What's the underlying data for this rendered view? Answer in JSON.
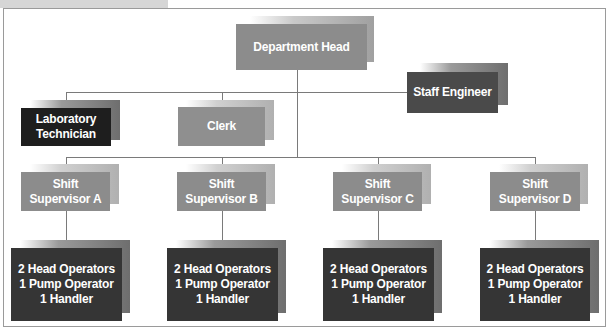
{
  "chart": {
    "title": "",
    "nodes": {
      "department_head": {
        "label": "Department Head",
        "color": "#8c8c8c"
      },
      "staff_engineer": {
        "label": "Staff Engineer",
        "color": "#4a4a4a"
      },
      "laboratory_technician": {
        "line1": "Laboratory",
        "line2": "Technician",
        "color": "#1e1e1e"
      },
      "clerk": {
        "label": "Clerk",
        "color": "#8f8f8f"
      },
      "shift_supervisors": [
        {
          "line1": "Shift",
          "line2": "Supervisor A",
          "color": "#8c8c8c"
        },
        {
          "line1": "Shift",
          "line2": "Supervisor B",
          "color": "#8c8c8c"
        },
        {
          "line1": "Shift",
          "line2": "Supervisor C",
          "color": "#8c8c8c"
        },
        {
          "line1": "Shift",
          "line2": "Supervisor D",
          "color": "#8c8c8c"
        }
      ],
      "crews": [
        {
          "line1": "2 Head Operators",
          "line2": "1 Pump Operator",
          "line3": "1 Handler",
          "color": "#353535"
        },
        {
          "line1": "2 Head Operators",
          "line2": "1 Pump Operator",
          "line3": "1 Handler",
          "color": "#353535"
        },
        {
          "line1": "2 Head Operators",
          "line2": "1 Pump Operator",
          "line3": "1 Handler",
          "color": "#353535"
        },
        {
          "line1": "2 Head Operators",
          "line2": "1 Pump Operator",
          "line3": "1 Handler",
          "color": "#353535"
        }
      ]
    },
    "edges": [
      [
        "Department Head",
        "Staff Engineer"
      ],
      [
        "Department Head",
        "Laboratory Technician"
      ],
      [
        "Department Head",
        "Clerk"
      ],
      [
        "Department Head",
        "Shift Supervisor A"
      ],
      [
        "Department Head",
        "Shift Supervisor B"
      ],
      [
        "Department Head",
        "Shift Supervisor C"
      ],
      [
        "Department Head",
        "Shift Supervisor D"
      ],
      [
        "Shift Supervisor A",
        "Crew A"
      ],
      [
        "Shift Supervisor B",
        "Crew B"
      ],
      [
        "Shift Supervisor C",
        "Crew C"
      ],
      [
        "Shift Supervisor D",
        "Crew D"
      ]
    ]
  }
}
